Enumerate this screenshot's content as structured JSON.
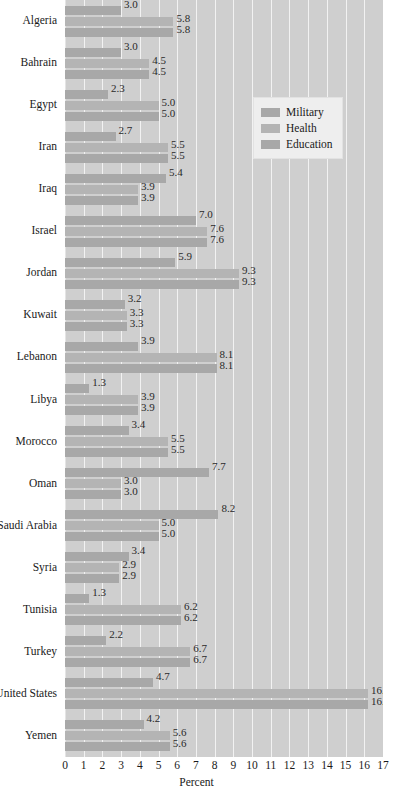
{
  "chart_data": {
    "type": "bar",
    "orientation": "horizontal",
    "title": "",
    "xlabel": "Percent",
    "ylabel": "",
    "xlim": [
      0,
      17
    ],
    "xticks": [
      0,
      1,
      2,
      3,
      4,
      5,
      6,
      7,
      8,
      9,
      10,
      11,
      12,
      13,
      14,
      15,
      16,
      17
    ],
    "grid": true,
    "legend_position": "upper right",
    "categories": [
      "Algeria",
      "Bahrain",
      "Egypt",
      "Iran",
      "Iraq",
      "Israel",
      "Jordan",
      "Kuwait",
      "Lebanon",
      "Libya",
      "Morocco",
      "Oman",
      "Saudi Arabia",
      "Syria",
      "Tunisia",
      "Turkey",
      "United States",
      "Yemen"
    ],
    "series": [
      {
        "name": "Military",
        "color": "#a8a8a8",
        "values": [
          3.0,
          3.0,
          2.3,
          2.7,
          5.4,
          7.0,
          5.9,
          3.2,
          3.9,
          1.3,
          3.4,
          7.7,
          8.2,
          3.4,
          1.3,
          2.2,
          4.7,
          4.2
        ],
        "labels": [
          "3.0",
          "3.0",
          "2.3",
          "2.7",
          "5.4",
          "7.0",
          "5.9",
          "3.2",
          "3.9",
          "1.3",
          "3.4",
          "7.7",
          "8.2",
          "3.4",
          "1.3",
          "2.2",
          "4.7",
          "4.2"
        ]
      },
      {
        "name": "Health",
        "color": "#b4b4b4",
        "values": [
          5.8,
          4.5,
          5.0,
          5.5,
          3.9,
          7.6,
          9.3,
          3.3,
          8.1,
          3.9,
          5.5,
          3.0,
          5.0,
          2.9,
          6.2,
          6.7,
          16.2,
          5.6
        ],
        "labels": [
          "5.8",
          "4.5",
          "5.0",
          "5.5",
          "3.9",
          "7.6",
          "9.3",
          "3.3",
          "8.1",
          "3.9",
          "5.5",
          "3.0",
          "5.0",
          "2.9",
          "6.2",
          "6.7",
          "16.2",
          "5.6"
        ]
      },
      {
        "name": "Education",
        "color": "#a8a8a8",
        "values": [
          5.8,
          4.5,
          5.0,
          5.5,
          3.9,
          7.6,
          9.3,
          3.3,
          8.1,
          3.9,
          5.5,
          3.0,
          5.0,
          2.9,
          6.2,
          6.7,
          16.2,
          5.6
        ],
        "labels": [
          "5.8",
          "4.5",
          "5.0",
          "5.5",
          "3.9",
          "7.6",
          "9.3",
          "3.3",
          "8.1",
          "3.9",
          "5.5",
          "3.0",
          "5.0",
          "2.9",
          "6.2",
          "6.7",
          "16.2",
          "5.6"
        ]
      }
    ]
  },
  "legend": {
    "items": [
      {
        "label": "Military"
      },
      {
        "label": "Health"
      },
      {
        "label": "Education"
      }
    ]
  },
  "axis": {
    "x_title": "Percent"
  },
  "colors": {
    "plot_background": "#cfcfcf",
    "gridline": "#f2f2f2",
    "bar_military": "#a8a8a8",
    "bar_health": "#b4b4b4",
    "bar_education": "#a8a8a8",
    "legend_background": "#eeeeee",
    "text": "#1a1a1a"
  }
}
